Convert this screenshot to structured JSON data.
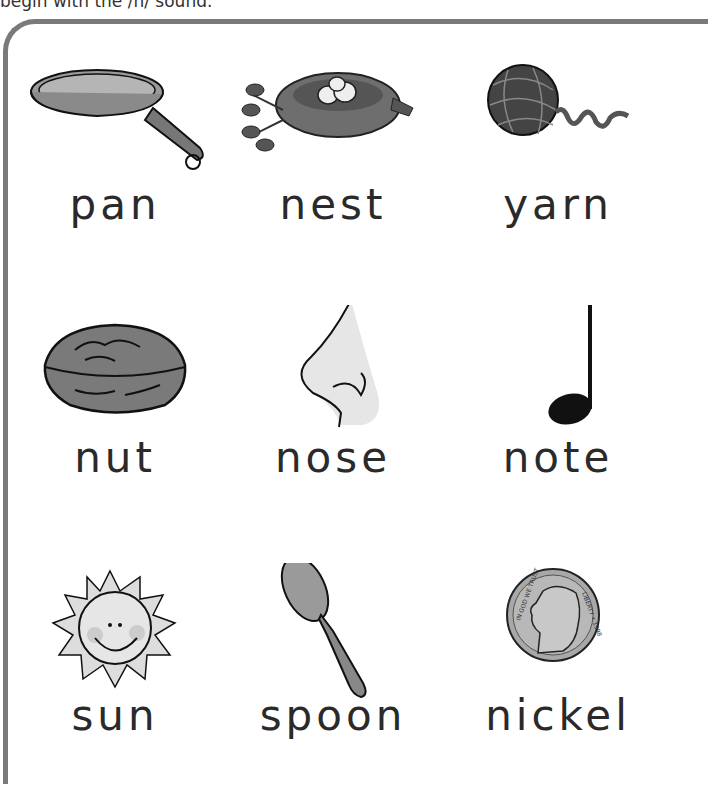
{
  "instruction": "begin with the /n/ sound.",
  "frame": {
    "border_color": "#7a7a7a"
  },
  "items": [
    {
      "word": "pan",
      "icon": "frying-pan-icon"
    },
    {
      "word": "nest",
      "icon": "bird-nest-icon"
    },
    {
      "word": "yarn",
      "icon": "yarn-ball-icon"
    },
    {
      "word": "nut",
      "icon": "walnut-icon"
    },
    {
      "word": "nose",
      "icon": "nose-icon"
    },
    {
      "word": "note",
      "icon": "music-note-icon"
    },
    {
      "word": "sun",
      "icon": "sun-icon"
    },
    {
      "word": "spoon",
      "icon": "spoon-icon"
    },
    {
      "word": "nickel",
      "icon": "nickel-coin-icon"
    }
  ],
  "coin_text": {
    "left": "IN GOD WE TRUST",
    "right": "LIBERTY • 1998"
  }
}
